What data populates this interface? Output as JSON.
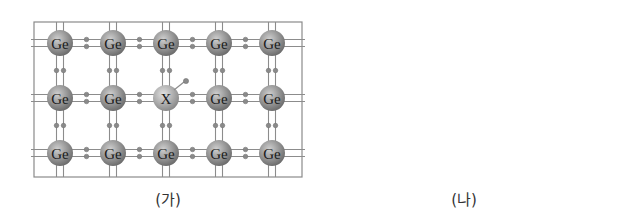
{
  "figure": {
    "panels": [
      {
        "id": "ga",
        "caption": "(가)",
        "grid_rows": 3,
        "grid_cols": 5,
        "atoms": [
          [
            "Ge",
            "Ge",
            "Ge",
            "Ge",
            "Ge"
          ],
          [
            "Ge",
            "Ge",
            "X",
            "Ge",
            "Ge"
          ],
          [
            "Ge",
            "Ge",
            "Ge",
            "Ge",
            "Ge"
          ]
        ],
        "dopant": "X",
        "dopant_feature": "extra electron"
      },
      {
        "id": "na",
        "caption": "(나)",
        "grid_rows": 3,
        "grid_cols": 5,
        "atoms": [
          [
            "Ge",
            "Ge",
            "Ge",
            "Ge",
            "Ge"
          ],
          [
            "Ge",
            "Ge",
            "Y",
            "Ge",
            "Ge"
          ],
          [
            "Ge",
            "Ge",
            "Ge",
            "Ge",
            "Ge"
          ]
        ],
        "dopant": "Y",
        "dopant_feature": "hole"
      }
    ],
    "colors": {
      "frame": "#8a8a8a",
      "bond": "#8c8c8c",
      "electron": "#8a8a8a",
      "atom_dark": "#6e6e6e",
      "atom_light": "#cfcfcf",
      "dopant_light": "#e2e2e2",
      "hole_fill": "#ffffff"
    }
  }
}
